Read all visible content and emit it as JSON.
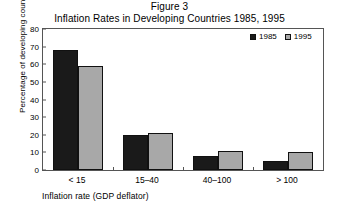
{
  "chart_data": {
    "type": "bar",
    "title": "Figure 3",
    "subtitle": "Inflation Rates in Developing Countries 1985, 1995",
    "xlabel": "Inflation rate (GDP deflator)",
    "ylabel": "Percentage of developing countries",
    "categories": [
      "< 15",
      "15–40",
      "40–100",
      "> 100"
    ],
    "series": [
      {
        "name": "1985",
        "color": "#1a1a1a",
        "values": [
          68,
          20,
          8,
          5
        ]
      },
      {
        "name": "1995",
        "color": "#a8a8a8",
        "values": [
          59,
          21,
          11,
          10
        ]
      }
    ],
    "ylim": [
      0,
      80
    ],
    "ytick_values": [
      0,
      10,
      20,
      30,
      40,
      50,
      60,
      70,
      80
    ],
    "ytick_labels": [
      "0",
      "10",
      "20",
      "30",
      "40",
      "50",
      "60",
      "70",
      "80"
    ],
    "grid": false,
    "legend_position": "top-right"
  },
  "legend": {
    "entries": [
      {
        "label": "1985"
      },
      {
        "label": "1995"
      }
    ]
  }
}
